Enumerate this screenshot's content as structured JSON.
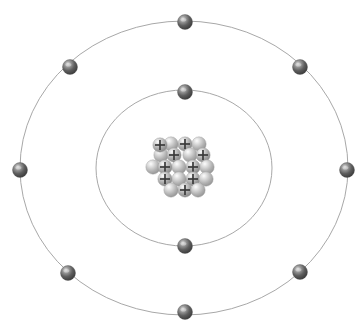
{
  "figure": {
    "title": "Bohr model of an atom",
    "width": 364,
    "height": 329,
    "background_color": "#ffffff",
    "center": {
      "x": 184,
      "y": 168
    }
  },
  "colors": {
    "orbit_stroke": "#a8a8a8",
    "electron_dark": "#4a4a4a",
    "electron_mid": "#8a8a8a",
    "electron_light": "#d8d8d8",
    "proton_dark": "#8d8d8d",
    "proton_mid": "#b4b4b4",
    "proton_light": "#efefef",
    "neutron_dark": "#9a9a9a",
    "neutron_mid": "#c2c2c2",
    "neutron_light": "#f4f4f4",
    "plus_mark": "#3a3a3a"
  },
  "orbits": [
    {
      "name": "inner-shell",
      "label": "K shell",
      "rx": 88,
      "ry": 78,
      "electron_count": 2
    },
    {
      "name": "outer-shell",
      "label": "L shell",
      "rx": 164,
      "ry": 147,
      "electron_count": 8
    }
  ],
  "electrons": {
    "radius": 7.5,
    "total": 10,
    "inner": [
      {
        "name": "electron-inner-top",
        "x": 185,
        "y": 92
      },
      {
        "name": "electron-inner-bottom",
        "x": 185,
        "y": 246
      }
    ],
    "outer": [
      {
        "name": "electron-outer-top",
        "x": 185,
        "y": 22
      },
      {
        "name": "electron-outer-upper-left",
        "x": 70,
        "y": 67
      },
      {
        "name": "electron-outer-upper-right",
        "x": 300,
        "y": 67
      },
      {
        "name": "electron-outer-left",
        "x": 20,
        "y": 170
      },
      {
        "name": "electron-outer-right",
        "x": 347,
        "y": 170
      },
      {
        "name": "electron-outer-lower-left",
        "x": 68,
        "y": 273
      },
      {
        "name": "electron-outer-lower-right",
        "x": 300,
        "y": 272
      },
      {
        "name": "electron-outer-bottom",
        "x": 185,
        "y": 312
      }
    ]
  },
  "nucleus": {
    "name": "nucleus",
    "center": {
      "x": 184,
      "y": 166
    },
    "particle_radius": 7.2,
    "proton_count": 10,
    "neutron_count": 10,
    "total_nucleons": 20,
    "proton_symbol": "+",
    "particles": [
      {
        "name": "neutron",
        "type": "neutron",
        "x": 171,
        "y": 144
      },
      {
        "name": "proton",
        "type": "proton",
        "x": 185,
        "y": 144
      },
      {
        "name": "neutron",
        "type": "neutron",
        "x": 199,
        "y": 144
      },
      {
        "name": "neutron",
        "type": "neutron",
        "x": 161,
        "y": 155
      },
      {
        "name": "proton",
        "type": "proton",
        "x": 174,
        "y": 155
      },
      {
        "name": "neutron",
        "type": "neutron",
        "x": 190,
        "y": 155
      },
      {
        "name": "proton",
        "type": "proton",
        "x": 203,
        "y": 155
      },
      {
        "name": "neutron",
        "type": "neutron",
        "x": 153,
        "y": 167
      },
      {
        "name": "proton",
        "type": "proton",
        "x": 165,
        "y": 167
      },
      {
        "name": "neutron",
        "type": "neutron",
        "x": 179,
        "y": 167
      },
      {
        "name": "proton",
        "type": "proton",
        "x": 193,
        "y": 167
      },
      {
        "name": "neutron",
        "type": "neutron",
        "x": 207,
        "y": 167
      },
      {
        "name": "proton",
        "type": "proton",
        "x": 165,
        "y": 179
      },
      {
        "name": "neutron",
        "type": "neutron",
        "x": 179,
        "y": 179
      },
      {
        "name": "proton",
        "type": "proton",
        "x": 193,
        "y": 179
      },
      {
        "name": "neutron",
        "type": "neutron",
        "x": 206,
        "y": 179
      },
      {
        "name": "neutron",
        "type": "neutron",
        "x": 171,
        "y": 190
      },
      {
        "name": "proton",
        "type": "proton",
        "x": 185,
        "y": 190
      },
      {
        "name": "neutron",
        "type": "neutron",
        "x": 198,
        "y": 190
      },
      {
        "name": "proton",
        "type": "proton",
        "x": 160,
        "y": 145
      }
    ]
  }
}
